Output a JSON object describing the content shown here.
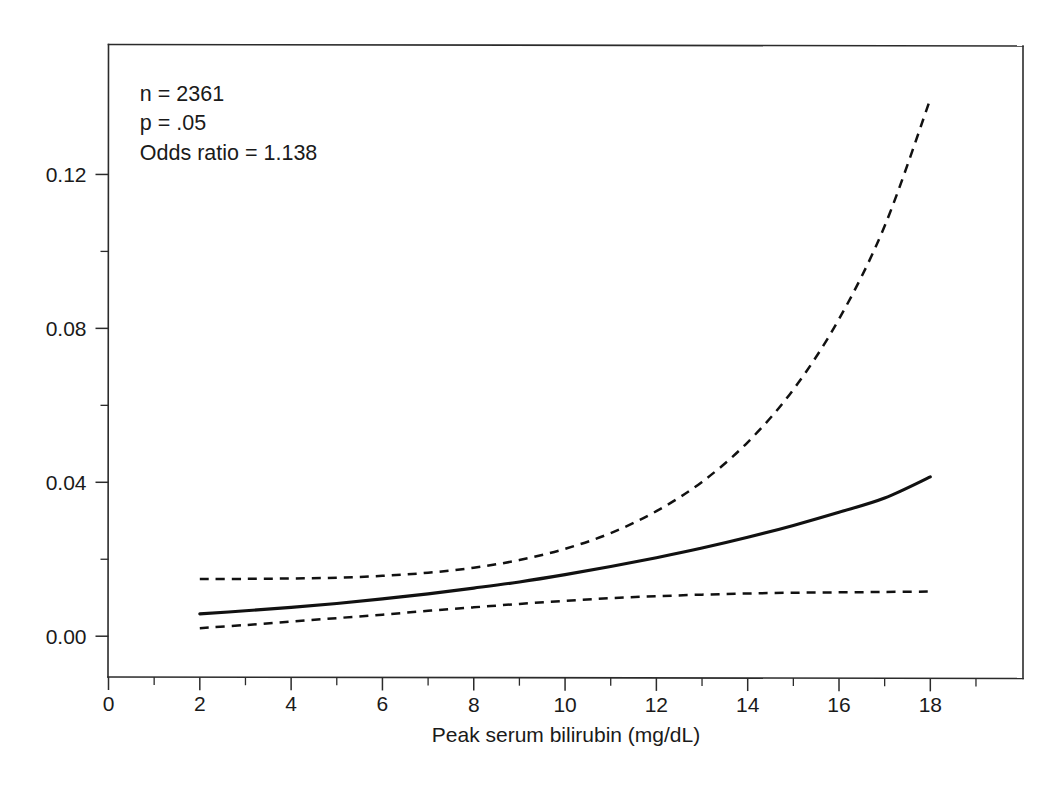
{
  "chart_data": {
    "type": "line",
    "title": "",
    "subtitle": "",
    "xlabel": "Peak serum bilirubin (mg/dL)",
    "ylabel": "",
    "xlim": [
      0,
      20.03
    ],
    "ylim": [
      -0.0106,
      0.1539
    ],
    "grid": false,
    "legend": "none",
    "x_ticks_major": [
      0,
      2,
      4,
      6,
      8,
      10,
      12,
      14,
      16,
      18
    ],
    "x_ticks_major_labels": [
      "0",
      "2",
      "4",
      "6",
      "8",
      "10",
      "12",
      "14",
      "16",
      "18"
    ],
    "x_ticks_minor": [
      1,
      3,
      5,
      7,
      9,
      11,
      13,
      15,
      17,
      19
    ],
    "y_ticks_major": [
      0.0,
      0.04,
      0.08,
      0.12
    ],
    "y_ticks_major_labels": [
      "0.00",
      "0.04",
      "0.08",
      "0.12"
    ],
    "y_ticks_minor": [
      0.02,
      0.06,
      0.1
    ],
    "x": [
      2,
      3,
      4,
      5,
      6,
      7,
      8,
      9,
      10,
      11,
      12,
      13,
      14,
      15,
      16,
      17,
      18
    ],
    "series": [
      {
        "name": "Fitted probability",
        "style": "solid",
        "values": [
          0.0058,
          0.0066,
          0.0075,
          0.0085,
          0.0097,
          0.011,
          0.0125,
          0.0141,
          0.016,
          0.0181,
          0.0204,
          0.0229,
          0.0257,
          0.0288,
          0.0322,
          0.0359,
          0.0414
        ]
      },
      {
        "name": "Upper 95% confidence limit",
        "style": "dashed",
        "values": [
          0.0149,
          0.0149,
          0.015,
          0.0152,
          0.0157,
          0.0165,
          0.0178,
          0.0198,
          0.0227,
          0.0268,
          0.0325,
          0.0401,
          0.0504,
          0.0641,
          0.0824,
          0.1066,
          0.1396
        ]
      },
      {
        "name": "Lower 95% confidence limit",
        "style": "dashed",
        "values": [
          0.0021,
          0.0029,
          0.0038,
          0.0047,
          0.0056,
          0.0066,
          0.0075,
          0.0084,
          0.0092,
          0.0099,
          0.0104,
          0.0108,
          0.0111,
          0.0113,
          0.0114,
          0.0115,
          0.0116
        ]
      }
    ],
    "annotations": [
      {
        "text": "n = 2361",
        "x": 2,
        "y": 0.1392
      },
      {
        "text": "p = .05",
        "x": 2,
        "y": 0.1315
      },
      {
        "text": "Odds ratio = 1.138",
        "x": 2,
        "y": 0.1238
      }
    ]
  },
  "colors": {
    "axis": "#2b2b2b",
    "curve": "#111111",
    "background": "#ffffff",
    "text": "#1a1a1a"
  }
}
